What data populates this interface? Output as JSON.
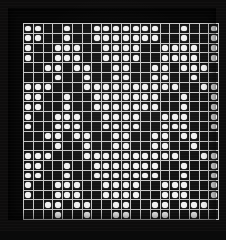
{
  "display": {
    "title": "dot-matrix-panel",
    "type": "binary-dot-matrix",
    "rows": 20,
    "columns": 20,
    "on_state_label": "lit",
    "off_state_label": "unlit",
    "colors": {
      "background": "#0d0c0c",
      "frame": "#070707",
      "gridline": "#c8c8c8",
      "cell_off": "#121212",
      "dot_on": "#f2f2f2"
    }
  },
  "grid": {
    "legend": "1 = lit dot, 0 = unlit cell",
    "cells": [
      [
        1,
        1,
        0,
        0,
        1,
        0,
        0,
        1,
        1,
        1,
        1,
        1,
        1,
        1,
        0,
        0,
        1,
        0,
        0,
        1
      ],
      [
        1,
        1,
        0,
        0,
        1,
        0,
        0,
        1,
        1,
        1,
        1,
        1,
        1,
        1,
        0,
        0,
        1,
        0,
        0,
        1
      ],
      [
        1,
        0,
        0,
        1,
        1,
        1,
        0,
        0,
        1,
        1,
        1,
        1,
        0,
        0,
        1,
        1,
        1,
        1,
        0,
        1
      ],
      [
        1,
        0,
        0,
        1,
        1,
        1,
        0,
        0,
        1,
        1,
        1,
        1,
        0,
        0,
        1,
        1,
        1,
        1,
        0,
        1
      ],
      [
        0,
        0,
        1,
        1,
        0,
        1,
        1,
        0,
        0,
        1,
        1,
        0,
        0,
        1,
        1,
        0,
        1,
        1,
        1,
        0
      ],
      [
        0,
        0,
        0,
        1,
        0,
        0,
        1,
        0,
        0,
        1,
        1,
        0,
        0,
        1,
        1,
        0,
        0,
        1,
        0,
        0
      ],
      [
        1,
        1,
        1,
        0,
        0,
        0,
        1,
        1,
        1,
        1,
        1,
        1,
        1,
        1,
        1,
        1,
        0,
        0,
        1,
        1
      ],
      [
        1,
        1,
        0,
        0,
        1,
        0,
        0,
        1,
        1,
        1,
        1,
        1,
        1,
        1,
        0,
        0,
        1,
        0,
        0,
        1
      ],
      [
        1,
        1,
        0,
        0,
        1,
        0,
        0,
        1,
        1,
        1,
        1,
        1,
        1,
        1,
        0,
        0,
        1,
        0,
        0,
        1
      ],
      [
        1,
        0,
        0,
        1,
        1,
        1,
        0,
        0,
        1,
        1,
        1,
        1,
        0,
        0,
        1,
        1,
        1,
        0,
        0,
        1
      ],
      [
        1,
        0,
        0,
        1,
        1,
        1,
        0,
        0,
        1,
        1,
        1,
        1,
        0,
        0,
        1,
        1,
        1,
        0,
        0,
        1
      ],
      [
        0,
        0,
        1,
        1,
        0,
        1,
        1,
        0,
        0,
        1,
        1,
        0,
        0,
        1,
        1,
        0,
        1,
        1,
        0,
        0
      ],
      [
        0,
        0,
        0,
        1,
        0,
        0,
        1,
        0,
        0,
        1,
        1,
        0,
        0,
        1,
        1,
        0,
        0,
        1,
        0,
        0
      ],
      [
        1,
        1,
        1,
        0,
        0,
        0,
        1,
        1,
        1,
        1,
        1,
        1,
        1,
        1,
        1,
        1,
        0,
        0,
        1,
        1
      ],
      [
        1,
        1,
        0,
        0,
        1,
        0,
        0,
        1,
        1,
        1,
        1,
        1,
        1,
        1,
        0,
        0,
        1,
        0,
        0,
        1
      ],
      [
        1,
        1,
        0,
        0,
        1,
        0,
        0,
        1,
        1,
        1,
        1,
        1,
        1,
        1,
        0,
        0,
        1,
        0,
        0,
        1
      ],
      [
        1,
        0,
        0,
        1,
        1,
        1,
        0,
        0,
        1,
        1,
        1,
        1,
        0,
        0,
        1,
        1,
        1,
        0,
        0,
        1
      ],
      [
        1,
        0,
        0,
        1,
        1,
        1,
        0,
        0,
        1,
        1,
        1,
        1,
        0,
        0,
        1,
        1,
        1,
        0,
        0,
        1
      ],
      [
        0,
        0,
        1,
        1,
        0,
        1,
        1,
        0,
        0,
        1,
        1,
        0,
        0,
        1,
        1,
        0,
        1,
        1,
        1,
        0
      ],
      [
        0,
        0,
        0,
        1,
        0,
        0,
        1,
        0,
        0,
        1,
        1,
        0,
        0,
        1,
        1,
        0,
        0,
        1,
        0,
        0
      ]
    ]
  }
}
